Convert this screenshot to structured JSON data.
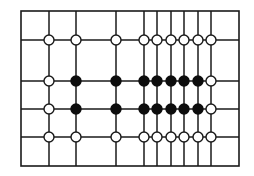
{
  "diagram": {
    "type": "grid-node-diagram",
    "colors": {
      "background": "#ffffff",
      "line": "#1a1a1a",
      "node_filled": "#0d0d0d",
      "node_open_fill": "#ffffff",
      "node_open_stroke": "#1a1a1a"
    },
    "border": {
      "x1": 21,
      "y1": 11,
      "x2": 239,
      "y2": 166
    },
    "vertical_lines_x": [
      49,
      76,
      116,
      144,
      157,
      171,
      184,
      198,
      211
    ],
    "horizontal_lines_y": [
      40,
      81,
      109,
      137
    ],
    "node_radius": 5,
    "rows": [
      {
        "y": 40,
        "states": [
          "open",
          "open",
          "open",
          "open",
          "open",
          "open",
          "open",
          "open",
          "open"
        ]
      },
      {
        "y": 81,
        "states": [
          "open",
          "filled",
          "filled",
          "filled",
          "filled",
          "filled",
          "filled",
          "filled",
          "open"
        ]
      },
      {
        "y": 109,
        "states": [
          "open",
          "filled",
          "filled",
          "filled",
          "filled",
          "filled",
          "filled",
          "filled",
          "open"
        ]
      },
      {
        "y": 137,
        "states": [
          "open",
          "open",
          "open",
          "open",
          "open",
          "open",
          "open",
          "open",
          "open"
        ]
      }
    ],
    "summary": {
      "columns": 9,
      "rows": 4,
      "filled_nodes": 14,
      "open_nodes": 22
    }
  }
}
